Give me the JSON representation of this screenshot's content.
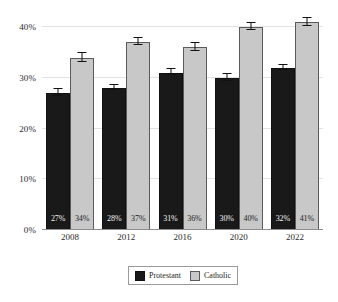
{
  "chart_data": {
    "type": "bar",
    "title": "",
    "subtitle": "",
    "xlabel": "",
    "ylabel": "",
    "categories": [
      "2008",
      "2012",
      "2016",
      "2020",
      "2022"
    ],
    "series": [
      {
        "name": "Protestant",
        "color": "#191919",
        "values": [
          27,
          28,
          31,
          30,
          32
        ],
        "value_labels": [
          "27%",
          "28%",
          "31%",
          "30%",
          "32%"
        ],
        "errors": [
          0.8,
          0.5,
          0.7,
          0.8,
          0.6
        ]
      },
      {
        "name": "Catholic",
        "color": "#c8c8c8",
        "values": [
          34,
          37,
          36,
          40,
          41
        ],
        "value_labels": [
          "34%",
          "37%",
          "36%",
          "40%",
          "41%"
        ],
        "errors": [
          1.0,
          0.8,
          0.9,
          0.8,
          0.9
        ]
      }
    ],
    "ylim": [
      0,
      42
    ],
    "y_ticks": [
      0,
      10,
      20,
      30,
      40
    ],
    "y_tick_labels": [
      "0%",
      "10%",
      "20%",
      "30%",
      "40%"
    ],
    "grid": true,
    "grid_axis": "y",
    "legend_position": "bottom",
    "error_bars": true
  },
  "legend": {
    "entries": [
      {
        "label": "Protestant",
        "swatch": "protestant"
      },
      {
        "label": "Catholic",
        "swatch": "catholic"
      }
    ]
  }
}
